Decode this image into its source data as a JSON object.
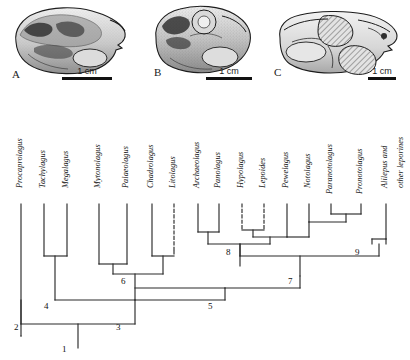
{
  "figure": {
    "type": "cladogram-with-specimen-photos",
    "panels": [
      {
        "letter": "A",
        "scale_label": "1 cm",
        "icon": "skull-lateral-photo"
      },
      {
        "letter": "B",
        "scale_label": "1 cm",
        "icon": "skull-lateral-photo"
      },
      {
        "letter": "C",
        "scale_label": "1 cm",
        "icon": "skull-lateral-photo-hatched"
      }
    ]
  },
  "tree": {
    "taxa": [
      {
        "id": "t1",
        "label": "Procaprolagus"
      },
      {
        "id": "t2",
        "label": "Tachylagus"
      },
      {
        "id": "t3",
        "label": "Megalagus"
      },
      {
        "id": "t4",
        "label": "Mytonolagus"
      },
      {
        "id": "t5",
        "label": "Palaeolagus"
      },
      {
        "id": "t6",
        "label": "Chadrolagus"
      },
      {
        "id": "t7",
        "label": "Litolagus"
      },
      {
        "id": "t8",
        "label": "Archaeolagus"
      },
      {
        "id": "t9",
        "label": "Panolagus"
      },
      {
        "id": "t10",
        "label": "Hypolagus"
      },
      {
        "id": "t11",
        "label": "Lepoides"
      },
      {
        "id": "t12",
        "label": "Pewelagus"
      },
      {
        "id": "t13",
        "label": "Notolagus"
      },
      {
        "id": "t14",
        "label": "Paranotolagus"
      },
      {
        "id": "t15",
        "label": "Pronotolagus"
      },
      {
        "id": "t16",
        "label": "Alilepus and"
      },
      {
        "id": "t17",
        "label": "other leporines"
      }
    ],
    "nodes": [
      {
        "id": "n1",
        "label": "1"
      },
      {
        "id": "n2",
        "label": "2"
      },
      {
        "id": "n3",
        "label": "3"
      },
      {
        "id": "n4",
        "label": "4"
      },
      {
        "id": "n5",
        "label": "5"
      },
      {
        "id": "n6",
        "label": "6"
      },
      {
        "id": "n7",
        "label": "7"
      },
      {
        "id": "n8",
        "label": "8"
      },
      {
        "id": "n9",
        "label": "9"
      }
    ],
    "line_color": "#2a2a2a",
    "dashed_branches": [
      "Litolagus",
      "Hypolagus",
      "Lepoides"
    ]
  }
}
